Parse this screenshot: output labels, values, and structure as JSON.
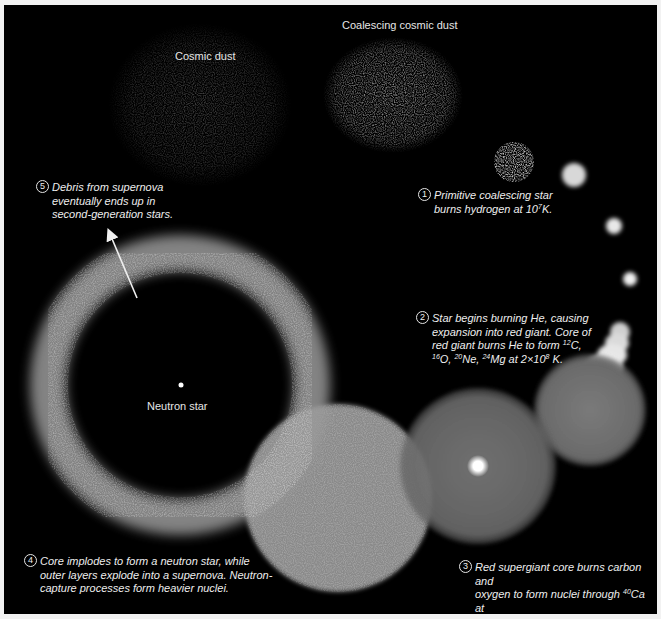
{
  "labels": {
    "cosmic_dust": "Cosmic dust",
    "coalescing_cosmic_dust": "Coalescing cosmic dust",
    "neutron_star": "Neutron star"
  },
  "steps": [
    {
      "num": "1",
      "lines": [
        "Primitive coalescing star",
        "burns hydrogen at 10^7K."
      ]
    },
    {
      "num": "2",
      "lines": [
        "Star begins burning He, causing",
        "expansion into red giant. Core of",
        "red giant burns He to form ^12C,",
        "^16O, ^20Ne, ^24Mg at 2×10^8 K."
      ]
    },
    {
      "num": "3",
      "lines": [
        "Red supergiant core burns carbon and",
        "oxygen to form nuclei through ^40Ca at",
        "7×10^8 K. Further heating to 3×10^9 K",
        "forms nuclei through ^56Fe and ^58Ni."
      ]
    },
    {
      "num": "4",
      "lines": [
        "Core implodes to form a neutron star, while",
        "outer layers explode into a supernova. Neutron-",
        "capture processes form heavier nuclei."
      ]
    },
    {
      "num": "5",
      "lines": [
        "Debris from supernova",
        "eventually ends up in",
        "second-generation stars."
      ]
    }
  ],
  "colors": {
    "background": "#000000",
    "frame": "#f2f2f2",
    "text": "#eeeeee",
    "sphere_gray": "#777777",
    "ring_gray": "#8a8a8a"
  }
}
